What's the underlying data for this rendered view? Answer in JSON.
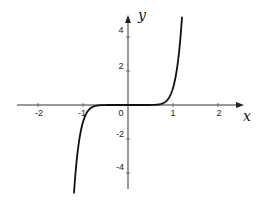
{
  "chart_data": {
    "type": "line",
    "title": "",
    "xlabel": "x",
    "ylabel": "y",
    "function": "y = x^9",
    "xlim": [
      -2.47,
      2.56
    ],
    "ylim": [
      -4.94,
      5.24
    ],
    "grid": false,
    "legend": null,
    "x_ticks": [
      -2,
      -1,
      0,
      1,
      2
    ],
    "x_tick_labels": [
      "-2",
      "-1",
      "0",
      "1",
      "2"
    ],
    "y_ticks": [
      -4,
      -2,
      2,
      4
    ],
    "y_tick_labels": [
      "-4",
      "-2",
      "2",
      "4"
    ],
    "series": [
      {
        "name": "y = x^9",
        "x": [
          -1.2,
          -1.15,
          -1.1,
          -1.05,
          -1.0,
          -0.95,
          -0.9,
          -0.8,
          -0.7,
          -0.5,
          0,
          0.5,
          0.7,
          0.8,
          0.9,
          0.95,
          1.0,
          1.05,
          1.1,
          1.15,
          1.2
        ],
        "y": [
          -5.16,
          -3.52,
          -2.36,
          -1.55,
          -1.0,
          -0.63,
          -0.39,
          -0.13,
          -0.04,
          0.0,
          0.0,
          0.0,
          0.04,
          0.13,
          0.39,
          0.63,
          1.0,
          1.55,
          2.36,
          3.52,
          5.16
        ],
        "color": "#111111"
      }
    ]
  },
  "labels": {
    "x_axis": "x",
    "y_axis": "y",
    "origin": "0",
    "xticks": [
      "-2",
      "-1",
      "1",
      "2"
    ],
    "yticks": [
      "4",
      "2",
      "-2",
      "-4"
    ]
  }
}
